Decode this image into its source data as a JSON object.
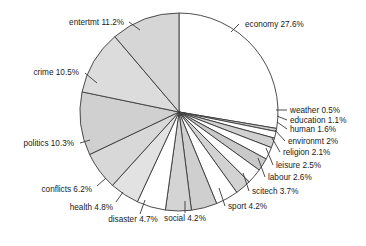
{
  "chart_data": {
    "type": "pie",
    "title": "",
    "xlabel": "",
    "ylabel": "",
    "legend_position": "none",
    "grid": false,
    "label_format": "{category} {value}%",
    "start_angle_deg": -90,
    "direction": "clockwise",
    "categories": [
      "economy",
      "weather",
      "education",
      "human",
      "environmt",
      "religion",
      "leisure",
      "labour",
      "scitech",
      "sport",
      "social",
      "disaster",
      "health",
      "conflicts",
      "politics",
      "crime",
      "entertmt"
    ],
    "values": [
      27.6,
      0.5,
      1.1,
      1.6,
      2.0,
      2.1,
      2.5,
      2.6,
      3.7,
      4.2,
      4.2,
      4.7,
      4.8,
      6.2,
      10.3,
      10.5,
      11.2
    ],
    "labels": [
      "economy 27.6%",
      "weather 0.5%",
      "education 1.1%",
      "human 1.6%",
      "environmt 2%",
      "religion 2.1%",
      "leisure 2.5%",
      "labour 2.6%",
      "scitech 3.7%",
      "sport 4.2%",
      "social 4.2%",
      "disaster 4.7%",
      "health 4.8%",
      "conflicts 6.2%",
      "politics 10.3%",
      "crime 10.5%",
      "entertmt 11.2%"
    ],
    "slice_colors": [
      "#ffffff",
      "#cccccc",
      "#ffffff",
      "#d0d0d0",
      "#ffffff",
      "#c9c9c9",
      "#ffffff",
      "#d2d2d2",
      "#ffffff",
      "#cfcfcf",
      "#d4d4d4",
      "#ffffff",
      "#e2e2e2",
      "#d8d8d8",
      "#d0d0d0",
      "#dcdcdc",
      "#d6d6d6"
    ],
    "label_anchors": [
      "start",
      "start",
      "start",
      "start",
      "start",
      "start",
      "start",
      "start",
      "start",
      "start",
      "middle",
      "middle",
      "end",
      "end",
      "end",
      "end",
      "end"
    ],
    "label_positions": [
      {
        "x": 245,
        "y": 27
      },
      {
        "x": 290,
        "y": 113
      },
      {
        "x": 290,
        "y": 123
      },
      {
        "x": 290,
        "y": 132
      },
      {
        "x": 288,
        "y": 144
      },
      {
        "x": 283,
        "y": 155
      },
      {
        "x": 276,
        "y": 168
      },
      {
        "x": 268,
        "y": 180
      },
      {
        "x": 252,
        "y": 194
      },
      {
        "x": 228,
        "y": 209
      },
      {
        "x": 185,
        "y": 221
      },
      {
        "x": 133,
        "y": 222
      },
      {
        "x": 113,
        "y": 210
      },
      {
        "x": 92,
        "y": 192
      },
      {
        "x": 74,
        "y": 146
      },
      {
        "x": 79,
        "y": 75
      },
      {
        "x": 124,
        "y": 25
      }
    ],
    "leader_lines": [
      [
        [
          239,
          24
        ],
        [
          231,
          32
        ]
      ],
      [
        [
          287,
          110
        ],
        [
          276,
          110
        ]
      ],
      [
        [
          287,
          120
        ],
        [
          277,
          116
        ]
      ],
      [
        [
          287,
          129
        ],
        [
          277,
          122
        ]
      ],
      [
        [
          285,
          141
        ],
        [
          275,
          130
        ]
      ],
      [
        [
          280,
          152
        ],
        [
          272,
          138
        ]
      ],
      [
        [
          273,
          165
        ],
        [
          266,
          148
        ]
      ],
      [
        [
          265,
          177
        ],
        [
          258,
          158
        ]
      ],
      [
        [
          249,
          191
        ],
        [
          243,
          173
        ]
      ],
      [
        [
          225,
          206
        ],
        [
          219,
          188
        ]
      ],
      [
        [
          185,
          213
        ],
        [
          185,
          201
        ]
      ],
      [
        [
          140,
          214
        ],
        [
          145,
          200
        ]
      ],
      [
        [
          116,
          202
        ],
        [
          123,
          192
        ]
      ],
      [
        [
          97,
          186
        ],
        [
          106,
          178
        ]
      ],
      [
        [
          80,
          143
        ],
        [
          90,
          140
        ]
      ],
      [
        [
          85,
          73
        ],
        [
          97,
          83
        ]
      ],
      [
        [
          129,
          22
        ],
        [
          140,
          30
        ]
      ]
    ],
    "geometry": {
      "center_x": 179,
      "center_y": 112,
      "radius": 99
    }
  }
}
